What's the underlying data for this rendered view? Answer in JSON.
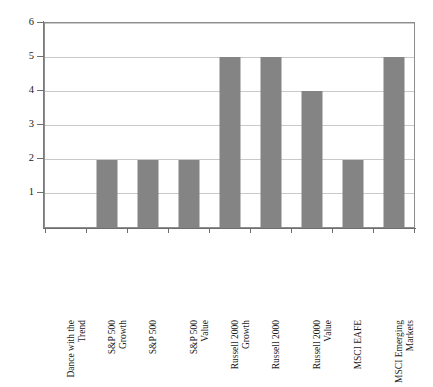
{
  "chart_data": {
    "type": "bar",
    "title": "",
    "subtitle": "",
    "xlabel": "",
    "ylabel": "",
    "ylim": [
      0,
      6
    ],
    "yticks": [
      "1",
      "2",
      "3",
      "4",
      "5",
      "6"
    ],
    "grid": true,
    "legend": "none",
    "bar_color": "#848484",
    "categories": [
      "Dance with the Trend",
      "S&P 500 Growth",
      "S&P 500",
      "S&P 500 Value",
      "Russell 2000 Growth",
      "Russell 2000",
      "Russell 2000 Value",
      "MSCI EAFE",
      "MSCI Emerging Markets"
    ],
    "category_lines": [
      [
        "Dance with the",
        "Trend"
      ],
      [
        "S&P 500",
        "Growth"
      ],
      [
        "S&P 500",
        ""
      ],
      [
        "S&P 500",
        "Value"
      ],
      [
        "Russell 2000",
        "Growth"
      ],
      [
        "Russell 2000",
        ""
      ],
      [
        "Russell 2000",
        "Value"
      ],
      [
        "MSCI EAFE",
        ""
      ],
      [
        "MSCI Emerging",
        "Markets"
      ]
    ],
    "values": [
      0,
      2,
      2,
      2,
      5,
      5,
      4,
      2,
      5
    ]
  },
  "colors": {
    "bar": "#848484",
    "grid": "#c9c9c9",
    "axis": "#6e6e6e",
    "frame": "#8d8d8d",
    "background": "#ffffff"
  }
}
